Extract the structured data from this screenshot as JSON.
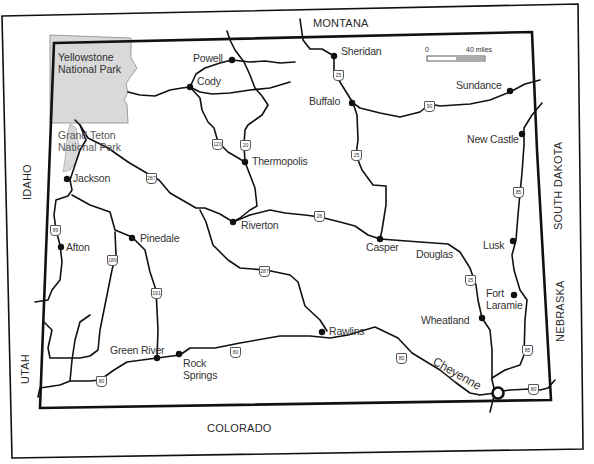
{
  "map": {
    "title": "Wyoming",
    "scale": {
      "start_label": "0",
      "end_label": "40 miles"
    },
    "neighbor_states": {
      "north": "MONTANA",
      "east_upper": "SOUTH DAKOTA",
      "east_lower": "NEBRASKA",
      "south": "COLORADO",
      "west_upper": "IDAHO",
      "west_lower": "UTAH"
    },
    "parks": [
      {
        "name": "Yellowstone National Park",
        "line1": "Yellowstone",
        "line2": "National Park"
      },
      {
        "name": "Grand Teton National Park",
        "line1": "Grand Teton",
        "line2": "National Park"
      }
    ],
    "cities": [
      {
        "name": "Powell"
      },
      {
        "name": "Cody"
      },
      {
        "name": "Sheridan"
      },
      {
        "name": "Buffalo"
      },
      {
        "name": "Sundance"
      },
      {
        "name": "New Castle"
      },
      {
        "name": "Thermopolis"
      },
      {
        "name": "Jackson"
      },
      {
        "name": "Riverton"
      },
      {
        "name": "Casper"
      },
      {
        "name": "Douglas"
      },
      {
        "name": "Lusk"
      },
      {
        "name": "Afton"
      },
      {
        "name": "Pinedale"
      },
      {
        "name": "Fort Laramie",
        "line1": "Fort",
        "line2": "Laramie"
      },
      {
        "name": "Wheatland"
      },
      {
        "name": "Rawlins"
      },
      {
        "name": "Green River"
      },
      {
        "name": "Rock Springs",
        "line1": "Rock",
        "line2": "Springs"
      },
      {
        "name": "Cheyenne"
      }
    ],
    "highways": [
      {
        "type": "interstate",
        "number": "25"
      },
      {
        "type": "interstate",
        "number": "90"
      },
      {
        "type": "interstate",
        "number": "80"
      },
      {
        "type": "us",
        "number": "20"
      },
      {
        "type": "us",
        "number": "26"
      },
      {
        "type": "us",
        "number": "85"
      },
      {
        "type": "us",
        "number": "89"
      },
      {
        "type": "us",
        "number": "120"
      },
      {
        "type": "us",
        "number": "189"
      },
      {
        "type": "us",
        "number": "191"
      },
      {
        "type": "us",
        "number": "287"
      }
    ],
    "colors": {
      "ink": "#111111",
      "park_fill": "#d9d9d9",
      "label": "#333333"
    }
  }
}
